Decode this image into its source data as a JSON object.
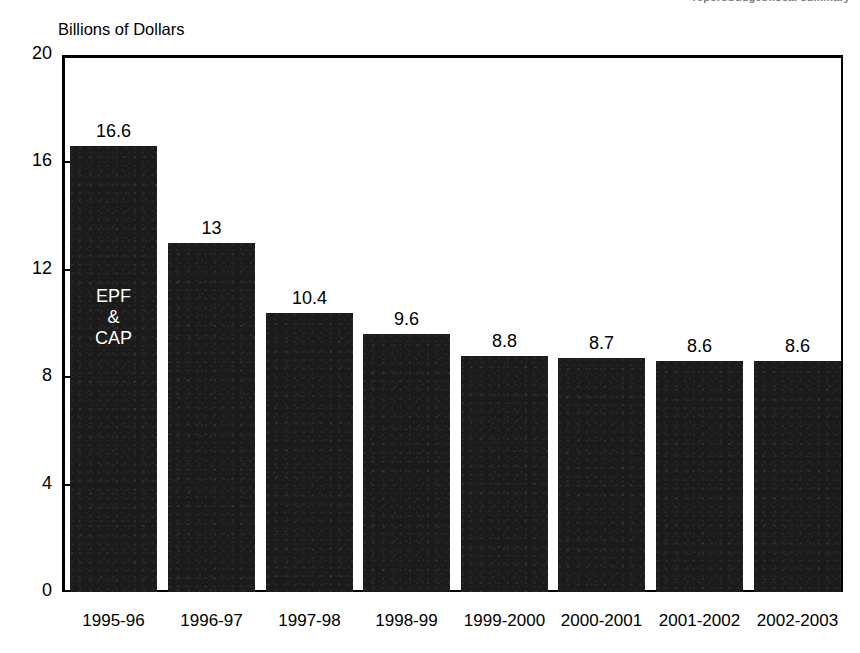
{
  "figure": {
    "axis_title": "Billions of Dollars",
    "clipped_top_note": "report/budget/fiscal summary",
    "bar_color": "#1b1b1b",
    "frame_color": "#000000",
    "background": "#ffffff"
  },
  "chart_data": {
    "type": "bar",
    "title": "",
    "subtitle": "",
    "xlabel": "",
    "ylabel": "Billions of Dollars",
    "ylim": [
      0,
      20
    ],
    "yticks": [
      20,
      16,
      12,
      8,
      4,
      0
    ],
    "grid": false,
    "legend": "none",
    "categories": [
      "1995-96",
      "1996-97",
      "1997-98",
      "1998-99",
      "1999-2000",
      "2000-2001",
      "2001-2002",
      "2002-2003"
    ],
    "values": [
      16.6,
      13,
      10.4,
      9.6,
      8.8,
      8.7,
      8.6,
      8.6
    ],
    "value_labels": [
      "16.6",
      "13",
      "10.4",
      "9.6",
      "8.8",
      "8.7",
      "8.6",
      "8.6"
    ],
    "annotations": [
      {
        "text": "EPF\n&\nCAP",
        "category": "1995-96",
        "position": "inside-bar",
        "color": "#ffffff"
      }
    ]
  }
}
